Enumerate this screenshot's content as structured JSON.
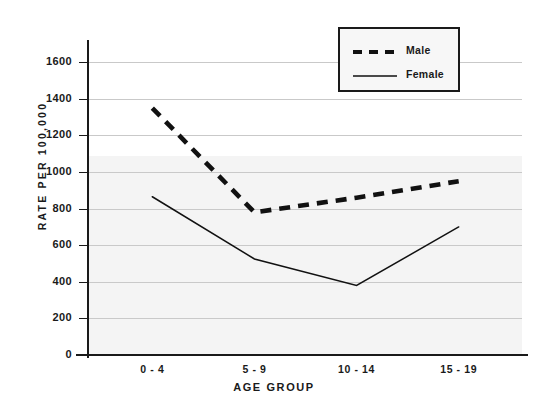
{
  "chart_data": {
    "type": "line",
    "title": "",
    "xlabel": "AGE GROUP",
    "ylabel": "RATE PER 100,000",
    "categories": [
      "0 - 4",
      "5 - 9",
      "10 - 14",
      "15 - 19"
    ],
    "ylim": [
      0,
      1700
    ],
    "yticks": [
      0,
      200,
      400,
      600,
      800,
      1000,
      1200,
      1400,
      1600
    ],
    "ytick_labels": [
      "0",
      "200",
      "400",
      "600",
      "800",
      "1000",
      "1200",
      "1400",
      "1600"
    ],
    "grid": true,
    "legend_position": "top-right",
    "series": [
      {
        "name": "Male",
        "style": "dashed",
        "color": "#111111",
        "values": [
          1350,
          780,
          860,
          950
        ]
      },
      {
        "name": "Female",
        "style": "solid",
        "color": "#111111",
        "values": [
          865,
          525,
          380,
          700
        ]
      }
    ]
  },
  "legend": {
    "entries": [
      {
        "label": "Male",
        "style": "dashed"
      },
      {
        "label": "Female",
        "style": "solid"
      }
    ]
  },
  "colors": {
    "ink": "#1a1a1a",
    "gridline": "#c9c9c9",
    "plot_background": "#ffffff",
    "wash": "#f4f4f4",
    "legend_background": "#f7f7f7"
  }
}
